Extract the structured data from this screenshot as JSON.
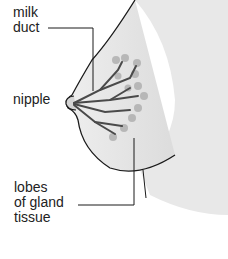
{
  "diagram": {
    "labels": {
      "milk_duct": "milk\nduct",
      "nipple": "nipple",
      "lobes": "lobes\nof gland\ntissue"
    },
    "colors": {
      "skin": "#e6e6e6",
      "outline": "#1a1a1a",
      "ducts": "#555555",
      "lobules": "#aaaaaa"
    }
  }
}
